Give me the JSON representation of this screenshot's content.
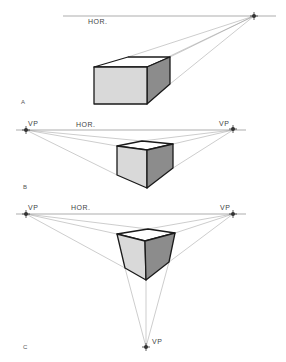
{
  "colors": {
    "line": "#9a9a9a",
    "edge": "#1a1a1a",
    "top_face": "#ffffff",
    "front_face": "#d9d9d9",
    "side_face": "#8c8c8c",
    "vp_marker": "#333333"
  },
  "figures": [
    {
      "id": "A",
      "label": "A",
      "type": "one-point perspective",
      "horizon_label": "HOR.",
      "vp_labels": []
    },
    {
      "id": "B",
      "label": "B",
      "type": "two-point perspective",
      "horizon_label": "HOR.",
      "vp_labels": [
        "VP",
        "VP"
      ]
    },
    {
      "id": "C",
      "label": "C",
      "type": "three-point perspective",
      "horizon_label": "HOR.",
      "vp_labels": [
        "VP",
        "VP",
        "VP"
      ]
    }
  ]
}
